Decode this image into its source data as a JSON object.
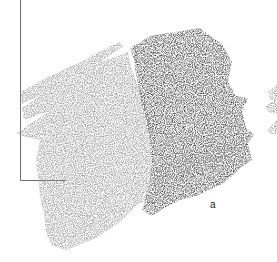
{
  "figure": {
    "panel_label": "a",
    "colors": {
      "background": "#ffffff",
      "light_swatch": "#9b9b9b",
      "dark_swatch": "#4b4b4b",
      "frame_line": "#6e6e6e"
    }
  }
}
